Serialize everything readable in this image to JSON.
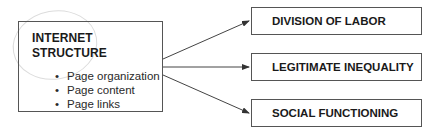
{
  "source": {
    "title_lines": [
      "INTERNET",
      "STRUCTURE"
    ],
    "bullets": [
      "Page organization",
      "Page content",
      "Page links"
    ],
    "bullet_glyph": "•"
  },
  "targets": [
    {
      "label": "DIVISION OF LABOR"
    },
    {
      "label": "LEGITIMATE INEQUALITY"
    },
    {
      "label": "SOCIAL FUNCTIONING"
    }
  ],
  "colors": {
    "stroke": "#555555",
    "text": "#1a1a1a",
    "sketch_circle": "#d8d8d8"
  }
}
